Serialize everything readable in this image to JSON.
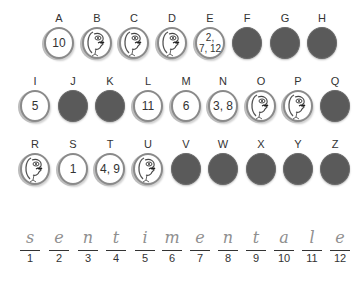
{
  "puzzle": {
    "rows": [
      {
        "cells": [
          {
            "letter": "A",
            "state": "number",
            "value": "10"
          },
          {
            "letter": "B",
            "state": "face",
            "value": ""
          },
          {
            "letter": "C",
            "state": "face",
            "value": ""
          },
          {
            "letter": "D",
            "state": "face",
            "value": ""
          },
          {
            "letter": "E",
            "state": "number",
            "value": "2,\n7, 12"
          },
          {
            "letter": "F",
            "state": "dark",
            "value": ""
          },
          {
            "letter": "G",
            "state": "dark",
            "value": ""
          },
          {
            "letter": "H",
            "state": "dark",
            "value": ""
          }
        ]
      },
      {
        "cells": [
          {
            "letter": "I",
            "state": "number",
            "value": "5"
          },
          {
            "letter": "J",
            "state": "dark",
            "value": ""
          },
          {
            "letter": "K",
            "state": "dark",
            "value": ""
          },
          {
            "letter": "L",
            "state": "number",
            "value": "11"
          },
          {
            "letter": "M",
            "state": "number",
            "value": "6"
          },
          {
            "letter": "N",
            "state": "number",
            "value": "3, 8"
          },
          {
            "letter": "O",
            "state": "face",
            "value": ""
          },
          {
            "letter": "P",
            "state": "face",
            "value": ""
          },
          {
            "letter": "Q",
            "state": "dark",
            "value": ""
          }
        ]
      },
      {
        "cells": [
          {
            "letter": "R",
            "state": "face",
            "value": ""
          },
          {
            "letter": "S",
            "state": "number",
            "value": "1"
          },
          {
            "letter": "T",
            "state": "number",
            "value": "4, 9"
          },
          {
            "letter": "U",
            "state": "face",
            "value": ""
          },
          {
            "letter": "V",
            "state": "dark",
            "value": ""
          },
          {
            "letter": "W",
            "state": "dark",
            "value": ""
          },
          {
            "letter": "X",
            "state": "dark",
            "value": ""
          },
          {
            "letter": "Y",
            "state": "dark",
            "value": ""
          },
          {
            "letter": "Z",
            "state": "dark",
            "value": ""
          }
        ]
      }
    ],
    "answer": {
      "slots": [
        {
          "index": "1",
          "letter": "s"
        },
        {
          "index": "2",
          "letter": "e"
        },
        {
          "index": "3",
          "letter": "n"
        },
        {
          "index": "4",
          "letter": "t"
        },
        {
          "index": "5",
          "letter": "i"
        },
        {
          "index": "6",
          "letter": "m"
        },
        {
          "index": "7",
          "letter": "e"
        },
        {
          "index": "8",
          "letter": "n"
        },
        {
          "index": "9",
          "letter": "t"
        },
        {
          "index": "10",
          "letter": "a"
        },
        {
          "index": "11",
          "letter": "l"
        },
        {
          "index": "12",
          "letter": "e"
        }
      ]
    },
    "colors": {
      "dark_coin": "#5a5a5a",
      "coin_border": "#8a8a8a",
      "handwriting": "#8f8f8f",
      "text": "#333333"
    }
  }
}
